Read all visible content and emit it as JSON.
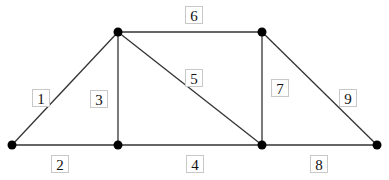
{
  "diagram": {
    "type": "truss",
    "nodes": [
      {
        "id": "A",
        "x": 12,
        "y": 145
      },
      {
        "id": "B",
        "x": 118,
        "y": 32
      },
      {
        "id": "C",
        "x": 118,
        "y": 145
      },
      {
        "id": "D",
        "x": 262,
        "y": 32
      },
      {
        "id": "E",
        "x": 262,
        "y": 145
      },
      {
        "id": "F",
        "x": 377,
        "y": 145
      }
    ],
    "members": [
      {
        "label": "1",
        "from": "A",
        "to": "B"
      },
      {
        "label": "2",
        "from": "A",
        "to": "C"
      },
      {
        "label": "3",
        "from": "B",
        "to": "C"
      },
      {
        "label": "4",
        "from": "C",
        "to": "E"
      },
      {
        "label": "5",
        "from": "B",
        "to": "E"
      },
      {
        "label": "6",
        "from": "B",
        "to": "D"
      },
      {
        "label": "7",
        "from": "D",
        "to": "E"
      },
      {
        "label": "8",
        "from": "E",
        "to": "F"
      },
      {
        "label": "9",
        "from": "D",
        "to": "F"
      }
    ],
    "labels": {
      "m1": "1",
      "m2": "2",
      "m3": "3",
      "m4": "4",
      "m5": "5",
      "m6": "6",
      "m7": "7",
      "m8": "8",
      "m9": "9"
    }
  }
}
